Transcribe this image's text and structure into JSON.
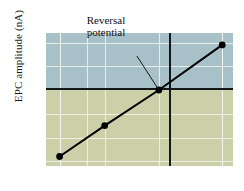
{
  "figure": {
    "ylabel": "EPC amplitude (nA)",
    "annotation_line1": "Reversal",
    "annotation_line2": "potential",
    "colors": {
      "positive_band": "#a8c0c8",
      "negative_band": "#ccd0a8",
      "gridline": "#f2f4ee",
      "axis": "#15181a",
      "data": "#000000"
    }
  },
  "reversal_markers": [
    {
      "id": "e-k",
      "symbol": "E",
      "subscript": "K",
      "x": -110
    },
    {
      "id": "e-cl",
      "symbol": "E",
      "subscript": "Cl",
      "x": -80
    },
    {
      "id": "e-na",
      "symbol": "E",
      "subscript": "Na",
      "x": 70
    }
  ],
  "chart_data": {
    "type": "line",
    "title": "",
    "xlabel": "",
    "ylabel": "EPC amplitude (nA)",
    "x": [
      -110,
      -60,
      0,
      70
    ],
    "values": [
      -280,
      -150,
      0,
      190
    ],
    "series": [
      {
        "name": "EPC amplitude",
        "values": [
          -280,
          -150,
          0,
          190
        ]
      }
    ],
    "xlim": [
      -125,
      82
    ],
    "ylim": [
      -320,
      240
    ],
    "xticks": [
      -110,
      -60,
      0,
      70
    ],
    "xticklabels": [
      "–110",
      "–60",
      "0",
      "+70"
    ],
    "yticks": [
      200,
      100,
      0,
      -100,
      -200,
      -300
    ],
    "yticklabels": [
      "200",
      "100",
      "0",
      "–100",
      "–200",
      "–300"
    ],
    "grid": true,
    "legend": null,
    "annotations": [
      {
        "text": "Reversal potential",
        "points_to_x": 0,
        "points_to_y": 0
      }
    ],
    "markers": [
      "E_K",
      "E_Cl",
      "E_Na"
    ]
  }
}
